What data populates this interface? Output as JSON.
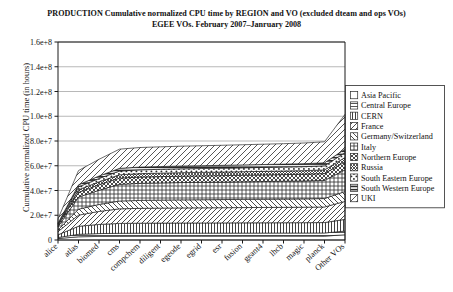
{
  "title": {
    "line1": "PRODUCTION Cumulative normalized CPU time by REGION and VO (excluded dteam and ops VOs)",
    "line2": "EGEE VOs. February 2007–Janruary 2008"
  },
  "axes": {
    "ylabel": "Cumulative normalized CPU time (in hours)",
    "xlabel": "",
    "yticks": [
      "0",
      "2.0e+7",
      "4.0e+7",
      "6.0e+7",
      "8.0e+7",
      "1.0e+8",
      "1.2e+8",
      "1.4e+8",
      "1.6e+8"
    ]
  },
  "legend": {
    "position": "right",
    "items": [
      {
        "label": "Asia Pacific",
        "pattern": "blank",
        "swatch_name": "legend-swatch-asia-pacific"
      },
      {
        "label": "Central Europe",
        "pattern": "horizontal",
        "swatch_name": "legend-swatch-central-europe"
      },
      {
        "label": "CERN",
        "pattern": "vertical",
        "swatch_name": "legend-swatch-cern"
      },
      {
        "label": "France",
        "pattern": "diagonal-right",
        "swatch_name": "legend-swatch-france"
      },
      {
        "label": "Germany/Switzerland",
        "pattern": "diagonal-left",
        "swatch_name": "legend-swatch-germany-switzerland"
      },
      {
        "label": "Italy",
        "pattern": "grid",
        "swatch_name": "legend-swatch-italy"
      },
      {
        "label": "Northern Europe",
        "pattern": "crosshatch",
        "swatch_name": "legend-swatch-northern-europe"
      },
      {
        "label": "Russia",
        "pattern": "dense-cross",
        "swatch_name": "legend-swatch-russia"
      },
      {
        "label": "South Eastern Europe",
        "pattern": "dots",
        "swatch_name": "legend-swatch-south-eastern-europe"
      },
      {
        "label": "South Western Europe",
        "pattern": "thick-horizontal",
        "swatch_name": "legend-swatch-south-western-europe"
      },
      {
        "label": "UKI",
        "pattern": "blank2",
        "swatch_name": "legend-swatch-uki"
      }
    ]
  },
  "chart_data": {
    "type": "area",
    "stacked": true,
    "title": "PRODUCTION Cumulative normalized CPU time by REGION and VO (excluded dteam and ops VOs)",
    "subtitle": "EGEE VOs. February 2007–Janruary 2008",
    "xlabel": "",
    "ylabel": "Cumulative normalized CPU time (in hours)",
    "ylim": [
      0,
      160000000
    ],
    "grid": true,
    "categories": [
      "alice",
      "atlas",
      "biomed",
      "cms",
      "compchem",
      "diligent",
      "egeode",
      "egrid",
      "esr",
      "fusion",
      "geant4",
      "lhcb",
      "magic",
      "planck",
      "Other VOs"
    ],
    "series": [
      {
        "name": "Asia Pacific",
        "pattern": "blank",
        "values": [
          1200000,
          2600000,
          2900000,
          3000000,
          3050000,
          3060000,
          3070000,
          3080000,
          3090000,
          3100000,
          3110000,
          3120000,
          3130000,
          3150000,
          4200000
        ]
      },
      {
        "name": "Central Europe",
        "pattern": "horizontal",
        "values": [
          800000,
          2000000,
          2300000,
          2400000,
          2430000,
          2440000,
          2450000,
          2460000,
          2470000,
          2480000,
          2490000,
          2500000,
          2510000,
          2530000,
          3000000
        ]
      },
      {
        "name": "CERN",
        "pattern": "vertical",
        "values": [
          2200000,
          6500000,
          7400000,
          8000000,
          8100000,
          8150000,
          8200000,
          8220000,
          8250000,
          8280000,
          8300000,
          8320000,
          8350000,
          8400000,
          9500000
        ]
      },
      {
        "name": "France",
        "pattern": "diagonal-right",
        "values": [
          2600000,
          9000000,
          10500000,
          11800000,
          12000000,
          12100000,
          12200000,
          12250000,
          12300000,
          12350000,
          12400000,
          12450000,
          12500000,
          12600000,
          14500000
        ]
      },
      {
        "name": "Germany/Switzerland",
        "pattern": "diagonal-left",
        "values": [
          1300000,
          4800000,
          5600000,
          6300000,
          6400000,
          6450000,
          6500000,
          6530000,
          6560000,
          6600000,
          6640000,
          6680000,
          6720000,
          6800000,
          8000000
        ]
      },
      {
        "name": "Italy",
        "pattern": "grid",
        "values": [
          2600000,
          9800000,
          11500000,
          13500000,
          13800000,
          13900000,
          14000000,
          14050000,
          14100000,
          14200000,
          14300000,
          14400000,
          14500000,
          14700000,
          17500000
        ]
      },
      {
        "name": "Northern Europe",
        "pattern": "crosshatch",
        "values": [
          1100000,
          3800000,
          4400000,
          5000000,
          5100000,
          5150000,
          5200000,
          5230000,
          5260000,
          5300000,
          5340000,
          5380000,
          5420000,
          5500000,
          6500000
        ]
      },
      {
        "name": "Russia",
        "pattern": "dense-cross",
        "values": [
          600000,
          2100000,
          2400000,
          2700000,
          2750000,
          2780000,
          2800000,
          2820000,
          2840000,
          2860000,
          2880000,
          2900000,
          2920000,
          2960000,
          3500000
        ]
      },
      {
        "name": "South Eastern Europe",
        "pattern": "dots",
        "values": [
          700000,
          2300000,
          2700000,
          3000000,
          3050000,
          3080000,
          3100000,
          3120000,
          3140000,
          3160000,
          3180000,
          3200000,
          3220000,
          3260000,
          3900000
        ]
      },
      {
        "name": "South Western Europe",
        "pattern": "thick-horizontal",
        "values": [
          500000,
          1700000,
          2000000,
          2200000,
          2250000,
          2270000,
          2290000,
          2310000,
          2330000,
          2350000,
          2370000,
          2390000,
          2410000,
          2450000,
          2900000
        ]
      },
      {
        "name": "UKI",
        "pattern": "blank2",
        "values": [
          3400000,
          11500000,
          13500000,
          15500000,
          15800000,
          15900000,
          16000000,
          16100000,
          16200000,
          16300000,
          16400000,
          16500000,
          16700000,
          17000000,
          28000000
        ]
      }
    ]
  }
}
